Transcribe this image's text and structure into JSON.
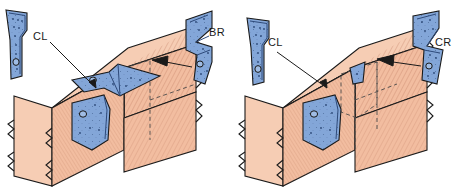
{
  "figure": {
    "background_color": "#ffffff",
    "width": 459,
    "height": 195
  },
  "colors": {
    "wood_light": "#f6cdb4",
    "wood_mid": "#f2bda0",
    "wood_dark": "#e8a98a",
    "wood_shadow": "#dd9c7c",
    "metal_light": "#9fbce4",
    "metal_mid": "#83a6d8",
    "metal_dark": "#6389c4",
    "metal_edge": "#2e4a7a",
    "outline": "#1a1a1a",
    "label_text": "#1a1a1a",
    "leader_line": "#1a1a1a",
    "hidden_line": "#4a4a4a"
  },
  "labels": [
    {
      "id": "label-cl-left",
      "text": "CL",
      "x": 33,
      "y": 40
    },
    {
      "id": "label-br",
      "text": "BR",
      "x": 209,
      "y": 36
    },
    {
      "id": "label-cl-right",
      "text": "CL",
      "x": 268,
      "y": 46
    },
    {
      "id": "label-cr",
      "text": "CR",
      "x": 435,
      "y": 46
    }
  ],
  "panels": [
    {
      "id": "panel-left",
      "name": "post-beam-joint-exposed",
      "description": "Isometric timber post and beam joint with exposed CL bracket on the post face and BR bracket seated over the beam top",
      "brackets_shown": [
        "CL",
        "BR"
      ],
      "installed_visible": true
    },
    {
      "id": "panel-right",
      "name": "post-beam-joint-concealed",
      "description": "Isometric timber post and beam joint with CL bracket on the post face and CR bracket concealed inside the beam shown with hidden dashed lines",
      "brackets_shown": [
        "CL",
        "CR"
      ],
      "installed_visible": false
    }
  ],
  "brackets": [
    {
      "id": "bracket-cl-left-detached",
      "code": "CL",
      "name": "concealed-left-bracket",
      "shape": "tapered-narrow-plate",
      "orientation": "vertical",
      "fastener_holes": 9,
      "large_hole": 1,
      "panel": "panel-left"
    },
    {
      "id": "bracket-br-detached",
      "code": "BR",
      "name": "beam-right-bracket",
      "shape": "angled-flanged-plate",
      "orientation": "vertical-with-flange",
      "fastener_holes": 8,
      "large_hole": 1,
      "panel": "panel-left"
    },
    {
      "id": "bracket-cl-right-detached",
      "code": "CL",
      "name": "concealed-left-bracket",
      "shape": "tapered-narrow-plate",
      "orientation": "vertical",
      "fastener_holes": 9,
      "large_hole": 1,
      "panel": "panel-right"
    },
    {
      "id": "bracket-cr-detached",
      "code": "CR",
      "name": "concealed-right-bracket",
      "shape": "tapered-wedge-plate",
      "orientation": "vertical",
      "fastener_holes": 8,
      "large_hole": 1,
      "panel": "panel-right"
    }
  ],
  "leaders": [
    {
      "id": "leader-cl-left",
      "from_label": "CL",
      "points_to": "installed-cl-bracket-left-panel"
    },
    {
      "id": "leader-br",
      "from_label": "BR",
      "points_to": "installed-br-bracket-left-panel"
    },
    {
      "id": "leader-cl-right",
      "from_label": "CL",
      "points_to": "installed-cl-bracket-right-panel"
    },
    {
      "id": "leader-cr",
      "from_label": "CR",
      "points_to": "installed-cr-bracket-right-panel"
    }
  ]
}
